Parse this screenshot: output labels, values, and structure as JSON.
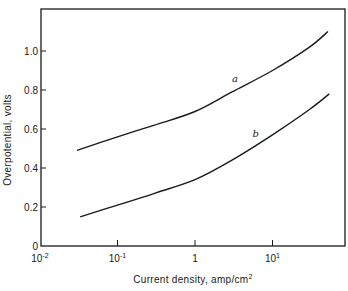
{
  "chart_data": {
    "type": "line",
    "title": "",
    "xlabel": "Current density, amp/cm²",
    "xlabel_parts": {
      "text": "Current density, amp/cm",
      "sup": "2"
    },
    "ylabel": "Overpotential, volts",
    "xscale": "log",
    "xlim": [
      0.01,
      100
    ],
    "ylim": [
      0,
      1.2
    ],
    "grid": false,
    "legend": "inline curve labels",
    "x_ticks": [
      {
        "value": 0.01,
        "base": "10",
        "exp": "-2"
      },
      {
        "value": 0.1,
        "base": "10",
        "exp": "-1"
      },
      {
        "value": 1,
        "base": "1",
        "exp": ""
      },
      {
        "value": 10,
        "base": "10",
        "exp": "1"
      }
    ],
    "y_ticks": [
      {
        "value": 0,
        "label": "0"
      },
      {
        "value": 0.2,
        "label": "0.2"
      },
      {
        "value": 0.4,
        "label": "0.4"
      },
      {
        "value": 0.6,
        "label": "0.6"
      },
      {
        "value": 0.8,
        "label": "0.8"
      },
      {
        "value": 1.0,
        "label": "1.0"
      }
    ],
    "series": [
      {
        "name": "a",
        "label_pos": {
          "x": 3.0,
          "y": 0.84
        },
        "x": [
          0.03,
          0.1,
          0.3,
          1,
          3,
          10,
          30,
          52
        ],
        "values": [
          0.49,
          0.56,
          0.62,
          0.69,
          0.79,
          0.9,
          1.02,
          1.1
        ]
      },
      {
        "name": "b",
        "label_pos": {
          "x": 5.5,
          "y": 0.56
        },
        "x": [
          0.033,
          0.1,
          0.3,
          1,
          3,
          10,
          30,
          54
        ],
        "values": [
          0.15,
          0.21,
          0.27,
          0.34,
          0.44,
          0.57,
          0.7,
          0.78
        ]
      }
    ]
  },
  "colors": {
    "line": "#1a1a1a",
    "background": "#ffffff"
  }
}
